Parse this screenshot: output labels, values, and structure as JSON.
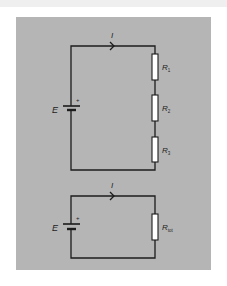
{
  "colors": {
    "page_background": "#ffffff",
    "top_strip": "#efefef",
    "panel": "#b5b5b5",
    "wire": "#1c1c1c",
    "resistor_fill": "#ffffff"
  },
  "circuits": [
    {
      "name": "series-circuit",
      "current_label": "I",
      "source": {
        "label": "E",
        "polarity": "+"
      },
      "resistors": [
        {
          "symbol": "R",
          "subscript": "1"
        },
        {
          "symbol": "R",
          "subscript": "2"
        },
        {
          "symbol": "R",
          "subscript": "3"
        }
      ]
    },
    {
      "name": "equivalent-circuit",
      "current_label": "I",
      "source": {
        "label": "E",
        "polarity": "+"
      },
      "resistors": [
        {
          "symbol": "R",
          "subscript": "tot"
        }
      ]
    }
  ]
}
